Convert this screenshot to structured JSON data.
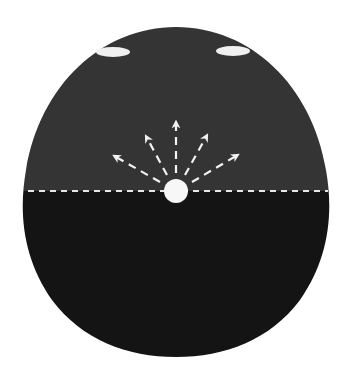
{
  "diagram": {
    "description": "Cross-section of a dome-shaped enclosure with a point light source on a dashed horizontal boundary emitting rays upward toward two reflective ellipses at the top",
    "colors": {
      "background": "#ffffff",
      "upper_region": "#343434",
      "lower_region": "#141414",
      "foreground": "#f2f2f2"
    },
    "elements": {
      "enclosure": {
        "label": "dome-enclosure"
      },
      "boundary_line": {
        "label": "dashed-boundary",
        "style": "dashed",
        "y": 191
      },
      "light_source": {
        "label": "light-source",
        "cx": 176,
        "cy": 191,
        "r": 12
      },
      "rays": [
        {
          "label": "ray-far-left",
          "angle_deg": 150
        },
        {
          "label": "ray-left",
          "angle_deg": 120
        },
        {
          "label": "ray-center",
          "angle_deg": 90
        },
        {
          "label": "ray-right",
          "angle_deg": 60
        },
        {
          "label": "ray-far-right",
          "angle_deg": 30
        }
      ],
      "ellipses": [
        {
          "label": "left-ellipse",
          "cx": 113,
          "cy": 52,
          "rx": 17,
          "ry": 5
        },
        {
          "label": "right-ellipse",
          "cx": 233,
          "cy": 51,
          "rx": 17,
          "ry": 5
        }
      ]
    }
  }
}
